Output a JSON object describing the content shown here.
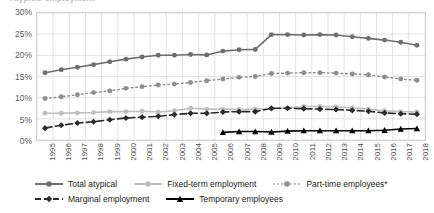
{
  "chart_title": "Atypical employment",
  "axes": {
    "y_ticks": [
      "0%",
      "5%",
      "10%",
      "15%",
      "20%",
      "25%",
      "30%"
    ],
    "x_ticks": [
      "1995",
      "1996",
      "1997",
      "1998",
      "1999",
      "2000",
      "2001",
      "2002",
      "2003",
      "2004",
      "2005",
      "2006",
      "2007",
      "2008",
      "2009",
      "2010",
      "2011",
      "2012",
      "2013",
      "2014",
      "2015",
      "2016",
      "2017",
      "2018"
    ]
  },
  "legend": {
    "row1": [
      {
        "label": "Total atypical",
        "key": "solid-circle-dark"
      },
      {
        "label": "Fixed-term employment",
        "key": "solid-circle-light"
      },
      {
        "label": "Part-time employees*",
        "key": "dotted-circle-mid"
      }
    ],
    "row2": [
      {
        "label": "Marginal employment",
        "key": "dashed-diamond-dark"
      },
      {
        "label": "Temporary employees",
        "key": "solid-triangle-black"
      }
    ]
  },
  "chart_data": {
    "type": "line",
    "title": "Atypical employment",
    "xlabel": "",
    "ylabel": "",
    "ylim": [
      0,
      30
    ],
    "xlim": [
      1995,
      2018
    ],
    "grid": true,
    "legend_position": "bottom",
    "x": [
      1995,
      1996,
      1997,
      1998,
      1999,
      2000,
      2001,
      2002,
      2003,
      2004,
      2005,
      2006,
      2007,
      2008,
      2009,
      2010,
      2011,
      2012,
      2013,
      2014,
      2015,
      2016,
      2017,
      2018
    ],
    "series": [
      {
        "name": "Total atypical",
        "color": "#6e6e6e",
        "style": "solid",
        "marker": "circle",
        "values": [
          15.9,
          16.6,
          17.2,
          17.8,
          18.5,
          19.1,
          19.6,
          20.0,
          20.0,
          20.2,
          20.1,
          21.0,
          21.3,
          21.4,
          24.9,
          24.9,
          24.8,
          24.9,
          24.8,
          24.4,
          24.0,
          23.6,
          23.1,
          22.4
        ]
      },
      {
        "name": "Part-time employees*",
        "color": "#8f8f8f",
        "style": "dotted",
        "marker": "circle",
        "values": [
          9.8,
          10.2,
          10.7,
          11.2,
          11.6,
          12.2,
          12.6,
          13.0,
          13.2,
          13.6,
          14.0,
          14.4,
          14.8,
          15.0,
          15.7,
          15.8,
          15.9,
          15.9,
          15.8,
          15.6,
          15.4,
          14.9,
          14.4,
          14.1
        ]
      },
      {
        "name": "Fixed-term employment",
        "color": "#bfbfbf",
        "style": "solid",
        "marker": "circle",
        "values": [
          6.3,
          6.3,
          6.4,
          6.5,
          6.7,
          6.7,
          6.8,
          6.6,
          6.9,
          7.5,
          7.3,
          7.3,
          7.2,
          7.3,
          7.3,
          7.6,
          7.9,
          7.9,
          7.8,
          7.6,
          7.3,
          6.9,
          6.7,
          6.6
        ]
      },
      {
        "name": "Marginal employment",
        "color": "#2b2b2b",
        "style": "dashed",
        "marker": "diamond",
        "values": [
          2.8,
          3.5,
          4.0,
          4.3,
          4.8,
          5.2,
          5.4,
          5.6,
          6.0,
          6.3,
          6.3,
          6.6,
          6.7,
          6.7,
          7.5,
          7.5,
          7.4,
          7.3,
          7.2,
          7.0,
          6.8,
          6.4,
          6.2,
          6.1
        ]
      },
      {
        "name": "Temporary employees",
        "color": "#000000",
        "style": "solid",
        "marker": "triangle",
        "values": [
          null,
          null,
          null,
          null,
          null,
          null,
          null,
          null,
          null,
          null,
          null,
          1.8,
          2.0,
          2.0,
          1.9,
          2.1,
          2.2,
          2.2,
          2.2,
          2.2,
          2.2,
          2.3,
          2.6,
          2.7
        ]
      }
    ]
  }
}
